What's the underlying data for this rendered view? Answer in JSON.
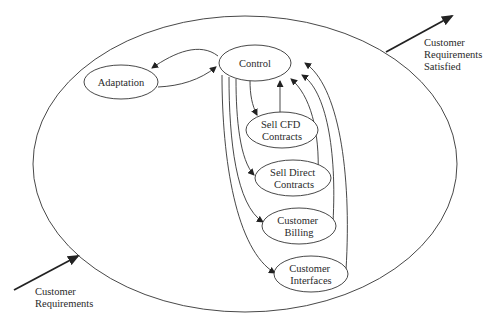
{
  "diagram": {
    "type": "state-flow",
    "boundary": {
      "name": "system-boundary"
    },
    "nodes": [
      {
        "id": "control",
        "lines": [
          "Control"
        ]
      },
      {
        "id": "adaptation",
        "lines": [
          "Adaptation"
        ]
      },
      {
        "id": "sell-cfd-contracts",
        "lines": [
          "Sell CFD",
          "Contracts"
        ]
      },
      {
        "id": "sell-direct-contracts",
        "lines": [
          "Sell Direct",
          "Contracts"
        ]
      },
      {
        "id": "customer-billing",
        "lines": [
          "Customer",
          "Billing"
        ]
      },
      {
        "id": "customer-interfaces",
        "lines": [
          "Customer",
          "Interfaces"
        ]
      }
    ],
    "edges": [
      {
        "from": "control",
        "to": "adaptation"
      },
      {
        "from": "adaptation",
        "to": "control"
      },
      {
        "from": "control",
        "to": "sell-cfd-contracts"
      },
      {
        "from": "sell-cfd-contracts",
        "to": "control"
      },
      {
        "from": "control",
        "to": "sell-direct-contracts"
      },
      {
        "from": "sell-direct-contracts",
        "to": "control"
      },
      {
        "from": "control",
        "to": "customer-billing"
      },
      {
        "from": "customer-billing",
        "to": "control"
      },
      {
        "from": "control",
        "to": "customer-interfaces"
      },
      {
        "from": "customer-interfaces",
        "to": "control"
      }
    ],
    "input": {
      "lines": [
        "Customer",
        "Requirements"
      ]
    },
    "output": {
      "lines": [
        "Customer",
        "Requirements",
        "Satisfied"
      ]
    }
  }
}
